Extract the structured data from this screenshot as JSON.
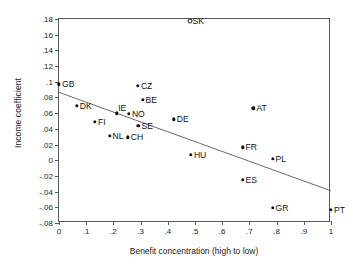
{
  "chart_data": {
    "type": "scatter",
    "title": "",
    "xlabel": "Benefit concentration (high to low)",
    "ylabel": "Income coefficient",
    "xlim": [
      0,
      1
    ],
    "ylim": [
      -0.08,
      0.18
    ],
    "grid": false,
    "legend": null,
    "xticks": [
      "0",
      ".1",
      ".2",
      ".3",
      ".4",
      ".5",
      ".6",
      ".7",
      ".8",
      ".9",
      "1"
    ],
    "xtickvalues": [
      0,
      0.1,
      0.2,
      0.3,
      0.4,
      0.5,
      0.6,
      0.7,
      0.8,
      0.9,
      1
    ],
    "yticks": [
      ".18",
      ".16",
      ".14",
      ".12",
      ".1",
      ".08",
      ".06",
      ".04",
      ".02",
      "0",
      "-.02",
      "-.04",
      "-.06",
      "-.08"
    ],
    "ytickvalues": [
      0.18,
      0.16,
      0.14,
      0.12,
      0.1,
      0.08,
      0.06,
      0.04,
      0.02,
      0,
      -0.02,
      -0.04,
      -0.06,
      -0.08
    ],
    "marker_color": "#111111",
    "line_color": "#6a6a6a",
    "frame_color": "#595959",
    "points": [
      {
        "label": "SK",
        "x": 0.48,
        "y": 0.177,
        "marker": "open-circle",
        "label_side": "right"
      },
      {
        "label": "CZ",
        "x": 0.29,
        "y": 0.095,
        "marker": "filled-circle",
        "label_side": "right"
      },
      {
        "label": "BE",
        "x": 0.307,
        "y": 0.077,
        "marker": "filled-circle",
        "label_side": "right"
      },
      {
        "label": "GB",
        "x": 0.0,
        "y": 0.097,
        "marker": "filled-circle",
        "label_side": "right"
      },
      {
        "label": "DK",
        "x": 0.065,
        "y": 0.069,
        "marker": "filled-circle",
        "label_side": "right"
      },
      {
        "label": "AT",
        "x": 0.715,
        "y": 0.066,
        "marker": "filled-circle",
        "label_side": "right"
      },
      {
        "label": "IE",
        "x": 0.212,
        "y": 0.06,
        "marker": "filled-circle",
        "label_side": "above-right"
      },
      {
        "label": "NO",
        "x": 0.257,
        "y": 0.059,
        "marker": "filled-circle",
        "label_side": "right"
      },
      {
        "label": "DE",
        "x": 0.422,
        "y": 0.052,
        "marker": "filled-circle",
        "label_side": "right"
      },
      {
        "label": "FI",
        "x": 0.132,
        "y": 0.049,
        "marker": "filled-circle",
        "label_side": "right"
      },
      {
        "label": "SE",
        "x": 0.292,
        "y": 0.0435,
        "marker": "filled-circle",
        "label_side": "right"
      },
      {
        "label": "NL",
        "x": 0.186,
        "y": 0.0315,
        "marker": "filled-circle",
        "label_side": "right"
      },
      {
        "label": "CH",
        "x": 0.253,
        "y": 0.029,
        "marker": "filled-circle",
        "label_side": "right"
      },
      {
        "label": "FR",
        "x": 0.675,
        "y": 0.0165,
        "marker": "filled-circle",
        "label_side": "right"
      },
      {
        "label": "HU",
        "x": 0.485,
        "y": 0.007,
        "marker": "filled-circle",
        "label_side": "right"
      },
      {
        "label": "PL",
        "x": 0.785,
        "y": 0.0015,
        "marker": "filled-circle",
        "label_side": "right"
      },
      {
        "label": "ES",
        "x": 0.675,
        "y": -0.025,
        "marker": "filled-circle",
        "label_side": "right"
      },
      {
        "label": "GR",
        "x": 0.785,
        "y": -0.061,
        "marker": "filled-circle",
        "label_side": "right"
      },
      {
        "label": "PT",
        "x": 1.0,
        "y": -0.063,
        "marker": "filled-circle",
        "label_side": "right"
      }
    ],
    "fit_line": {
      "x1": 0.0,
      "y1": 0.0865,
      "x2": 1.0,
      "y2": -0.039
    }
  }
}
